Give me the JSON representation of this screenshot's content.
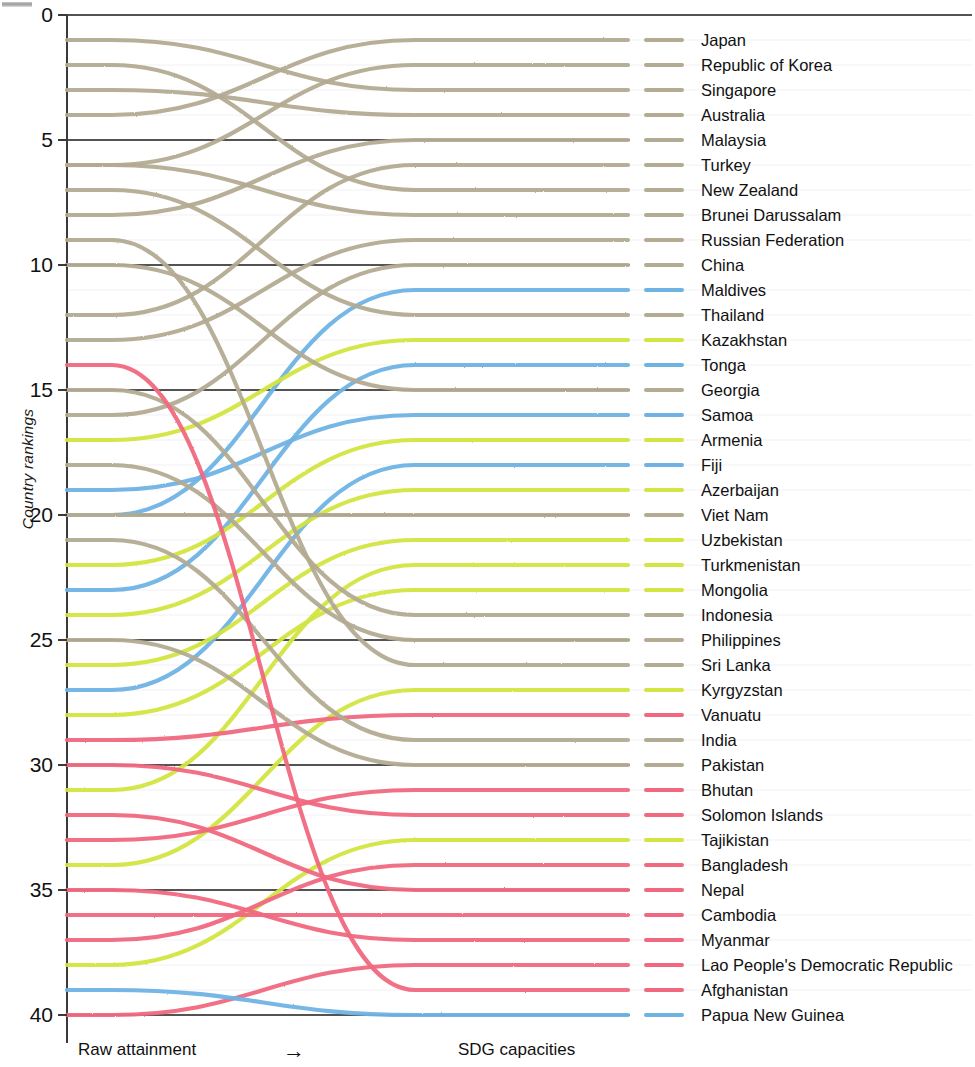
{
  "figure": {
    "y_axis_title": "Country rankings",
    "x_left_caption": "Raw attainment",
    "x_arrow": "→",
    "x_right_caption": "SDG capacities",
    "y_ticks": [
      "0",
      "5",
      "10",
      "15",
      "20",
      "25",
      "30",
      "35",
      "40"
    ],
    "y_tick_values": [
      0,
      5,
      10,
      15,
      20,
      25,
      30,
      35,
      40
    ]
  },
  "colors": {
    "blue": "#6fb3e4",
    "khaki": "#b3ab92",
    "lime": "#d3e542",
    "pink": "#f0697f",
    "axis": "#3a3a3a",
    "gridline_major": "#1a1a1a",
    "gridline_minor": "#dcdce8",
    "text": "#111111"
  },
  "chart_data": {
    "type": "line",
    "title": "",
    "subtitle": "",
    "xlabel": "Raw attainment → SDG capacities",
    "ylabel": "Country rankings",
    "ylim": [
      0,
      40
    ],
    "y_inverted": true,
    "xlim": [
      0,
      1
    ],
    "grid": "horizontal major lines at every rank 5 plus faint minor lines",
    "legend": "right",
    "x": [
      0,
      1
    ],
    "x_tick_labels": [
      "Raw attainment",
      "SDG capacities"
    ],
    "note": "Slopegraph / bump chart: each series has a starting rank under Raw attainment and an ending rank under SDG capacities; the curve is a smooth interpolation between them.",
    "series": [
      {
        "name": "Japan",
        "color_group": "khaki",
        "color": "#b3ab92",
        "start_rank": 4,
        "end_rank": 1
      },
      {
        "name": "Republic of Korea",
        "color_group": "khaki",
        "color": "#b3ab92",
        "start_rank": 6,
        "end_rank": 2
      },
      {
        "name": "Singapore",
        "color_group": "khaki",
        "color": "#b3ab92",
        "start_rank": 1,
        "end_rank": 3
      },
      {
        "name": "Australia",
        "color_group": "khaki",
        "color": "#b3ab92",
        "start_rank": 3,
        "end_rank": 4
      },
      {
        "name": "Malaysia",
        "color_group": "khaki",
        "color": "#b3ab92",
        "start_rank": 8,
        "end_rank": 5
      },
      {
        "name": "Turkey",
        "color_group": "khaki",
        "color": "#b3ab92",
        "start_rank": 12,
        "end_rank": 6
      },
      {
        "name": "New Zealand",
        "color_group": "khaki",
        "color": "#b3ab92",
        "start_rank": 2,
        "end_rank": 7
      },
      {
        "name": "Brunei Darussalam",
        "color_group": "khaki",
        "color": "#b3ab92",
        "start_rank": 6,
        "end_rank": 8
      },
      {
        "name": "Russian Federation",
        "color_group": "khaki",
        "color": "#b3ab92",
        "start_rank": 13,
        "end_rank": 9
      },
      {
        "name": "China",
        "color_group": "khaki",
        "color": "#b3ab92",
        "start_rank": 16,
        "end_rank": 10
      },
      {
        "name": "Maldives",
        "color_group": "blue",
        "color": "#6fb3e4",
        "start_rank": 20,
        "end_rank": 11
      },
      {
        "name": "Thailand",
        "color_group": "khaki",
        "color": "#b3ab92",
        "start_rank": 7,
        "end_rank": 12
      },
      {
        "name": "Kazakhstan",
        "color_group": "lime",
        "color": "#d3e542",
        "start_rank": 17,
        "end_rank": 13
      },
      {
        "name": "Tonga",
        "color_group": "blue",
        "color": "#6fb3e4",
        "start_rank": 23,
        "end_rank": 14
      },
      {
        "name": "Georgia",
        "color_group": "khaki",
        "color": "#b3ab92",
        "start_rank": 10,
        "end_rank": 15
      },
      {
        "name": "Samoa",
        "color_group": "blue",
        "color": "#6fb3e4",
        "start_rank": 19,
        "end_rank": 16
      },
      {
        "name": "Armenia",
        "color_group": "lime",
        "color": "#d3e542",
        "start_rank": 22,
        "end_rank": 17
      },
      {
        "name": "Fiji",
        "color_group": "blue",
        "color": "#6fb3e4",
        "start_rank": 27,
        "end_rank": 18
      },
      {
        "name": "Azerbaijan",
        "color_group": "lime",
        "color": "#d3e542",
        "start_rank": 24,
        "end_rank": 19
      },
      {
        "name": "Viet Nam",
        "color_group": "khaki",
        "color": "#b3ab92",
        "start_rank": 20,
        "end_rank": 20
      },
      {
        "name": "Uzbekistan",
        "color_group": "lime",
        "color": "#d3e542",
        "start_rank": 26,
        "end_rank": 21
      },
      {
        "name": "Turkmenistan",
        "color_group": "lime",
        "color": "#d3e542",
        "start_rank": 31,
        "end_rank": 22
      },
      {
        "name": "Mongolia",
        "color_group": "lime",
        "color": "#d3e542",
        "start_rank": 28,
        "end_rank": 23
      },
      {
        "name": "Indonesia",
        "color_group": "khaki",
        "color": "#b3ab92",
        "start_rank": 15,
        "end_rank": 24
      },
      {
        "name": "Philippines",
        "color_group": "khaki",
        "color": "#b3ab92",
        "start_rank": 18,
        "end_rank": 25
      },
      {
        "name": "Sri Lanka",
        "color_group": "khaki",
        "color": "#b3ab92",
        "start_rank": 9,
        "end_rank": 26
      },
      {
        "name": "Kyrgyzstan",
        "color_group": "lime",
        "color": "#d3e542",
        "start_rank": 34,
        "end_rank": 27
      },
      {
        "name": "Vanuatu",
        "color_group": "pink",
        "color": "#f0697f",
        "start_rank": 29,
        "end_rank": 28
      },
      {
        "name": "India",
        "color_group": "khaki",
        "color": "#b3ab92",
        "start_rank": 21,
        "end_rank": 29
      },
      {
        "name": "Pakistan",
        "color_group": "khaki",
        "color": "#b3ab92",
        "start_rank": 25,
        "end_rank": 30
      },
      {
        "name": "Bhutan",
        "color_group": "pink",
        "color": "#f0697f",
        "start_rank": 33,
        "end_rank": 31
      },
      {
        "name": "Solomon Islands",
        "color_group": "pink",
        "color": "#f0697f",
        "start_rank": 30,
        "end_rank": 32
      },
      {
        "name": "Tajikistan",
        "color_group": "lime",
        "color": "#d3e542",
        "start_rank": 38,
        "end_rank": 33
      },
      {
        "name": "Bangladesh",
        "color_group": "pink",
        "color": "#f0697f",
        "start_rank": 37,
        "end_rank": 34
      },
      {
        "name": "Nepal",
        "color_group": "pink",
        "color": "#f0697f",
        "start_rank": 32,
        "end_rank": 35
      },
      {
        "name": "Cambodia",
        "color_group": "pink",
        "color": "#f0697f",
        "start_rank": 36,
        "end_rank": 36
      },
      {
        "name": "Myanmar",
        "color_group": "pink",
        "color": "#f0697f",
        "start_rank": 35,
        "end_rank": 37
      },
      {
        "name": "Lao People's Democratic Republic",
        "color_group": "pink",
        "color": "#f0697f",
        "start_rank": 40,
        "end_rank": 38
      },
      {
        "name": "Afghanistan",
        "color_group": "pink",
        "color": "#f0697f",
        "start_rank": 14,
        "end_rank": 39
      },
      {
        "name": "Papua New Guinea",
        "color_group": "blue",
        "color": "#6fb3e4",
        "start_rank": 39,
        "end_rank": 40
      }
    ]
  }
}
